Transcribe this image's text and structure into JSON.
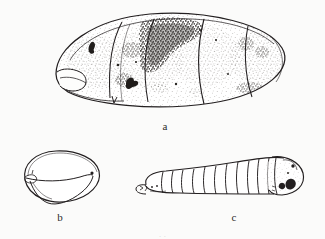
{
  "plate": {
    "kind": "scientific-line-drawing-plate",
    "background_color": "#fbfbfa",
    "ink_color": "#231f20",
    "width": 325,
    "height": 239,
    "figures": [
      {
        "id": "a",
        "label": "a",
        "subject": "puparium",
        "description": "Oval segmented puparium in lateral view with stippled shading and dense dark speckle patch on the dorsal anterior region",
        "label_x": 165,
        "label_y": 127
      },
      {
        "id": "b",
        "label": "b",
        "subject": "puparium-anterior-view",
        "description": "Rounded puparium shown from a second angle with a ventral fold or flap",
        "label_x": 60,
        "label_y": 218
      },
      {
        "id": "c",
        "label": "c",
        "subject": "larva",
        "description": "Segmented larva (maggot) with narrow tapered head at left and broad posterior bearing dark spiracular markings at right",
        "label_x": 234,
        "label_y": 218
      }
    ],
    "caption_cutoff": "·                                   ·"
  }
}
